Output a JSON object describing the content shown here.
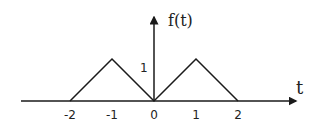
{
  "chart_data": {
    "type": "line",
    "title": "",
    "xlabel": "t",
    "ylabel": "f(t)",
    "x": [
      -2,
      -1,
      0,
      1,
      2
    ],
    "series": [
      {
        "name": "f(t)",
        "values": [
          0,
          1,
          0,
          1,
          0
        ]
      }
    ],
    "x_ticks": [
      "-2",
      "-1",
      "0",
      "1",
      "2"
    ],
    "y_ticks": [
      "1"
    ],
    "xlim": [
      -3.6,
      3.4
    ],
    "ylim": [
      0,
      2
    ],
    "grid": false,
    "legend": "none"
  },
  "labels": {
    "x_axis": "t",
    "y_axis": "f(t)",
    "y_tick_1": "1",
    "x_ticks": [
      "-2",
      "-1",
      "0",
      "1",
      "2"
    ]
  },
  "colors": {
    "line": "#1a1a1a",
    "axis": "#1a1a1a",
    "background": "#ffffff"
  }
}
